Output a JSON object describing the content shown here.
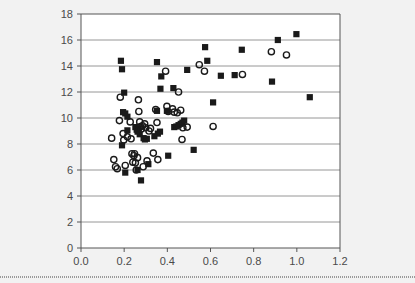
{
  "chart_data": {
    "type": "scatter",
    "title": "",
    "xlabel": "",
    "ylabel": "",
    "xlim": [
      0.0,
      1.2
    ],
    "ylim": [
      0,
      18
    ],
    "xticks": [
      "0.0",
      "0.2",
      "0.4",
      "0.6",
      "0.8",
      "1.0",
      "1.2"
    ],
    "xtick_values": [
      0.0,
      0.2,
      0.4,
      0.6,
      0.8,
      1.0,
      1.2
    ],
    "yticks": [
      "0",
      "2",
      "4",
      "6",
      "8",
      "10",
      "12",
      "14",
      "16",
      "18"
    ],
    "ytick_values": [
      0,
      2,
      4,
      6,
      8,
      10,
      12,
      14,
      16,
      18
    ],
    "grid": "horizontal",
    "legend": "none",
    "series": [
      {
        "name": "filled-squares",
        "marker": "square",
        "color": "#1a1a1a",
        "filled": true,
        "points": [
          [
            0.185,
            14.4
          ],
          [
            0.19,
            13.75
          ],
          [
            0.2,
            11.95
          ],
          [
            0.195,
            10.45
          ],
          [
            0.205,
            10.35
          ],
          [
            0.215,
            10.1
          ],
          [
            0.215,
            9.05
          ],
          [
            0.19,
            7.9
          ],
          [
            0.205,
            5.8
          ],
          [
            0.252,
            9.3
          ],
          [
            0.258,
            9.1
          ],
          [
            0.262,
            8.95
          ],
          [
            0.268,
            9.2
          ],
          [
            0.272,
            8.75
          ],
          [
            0.262,
            6.0
          ],
          [
            0.278,
            5.2
          ],
          [
            0.29,
            8.45
          ],
          [
            0.296,
            8.35
          ],
          [
            0.305,
            8.4
          ],
          [
            0.312,
            6.45
          ],
          [
            0.352,
            14.3
          ],
          [
            0.368,
            12.25
          ],
          [
            0.372,
            13.2
          ],
          [
            0.352,
            10.55
          ],
          [
            0.34,
            8.6
          ],
          [
            0.356,
            8.8
          ],
          [
            0.366,
            8.95
          ],
          [
            0.398,
            10.55
          ],
          [
            0.404,
            7.1
          ],
          [
            0.428,
            12.3
          ],
          [
            0.432,
            9.3
          ],
          [
            0.442,
            9.35
          ],
          [
            0.452,
            9.45
          ],
          [
            0.462,
            9.55
          ],
          [
            0.47,
            9.65
          ],
          [
            0.478,
            9.8
          ],
          [
            0.492,
            13.7
          ],
          [
            0.522,
            7.55
          ],
          [
            0.575,
            15.45
          ],
          [
            0.585,
            14.4
          ],
          [
            0.612,
            11.2
          ],
          [
            0.648,
            13.25
          ],
          [
            0.712,
            13.3
          ],
          [
            0.745,
            15.25
          ],
          [
            0.885,
            12.8
          ],
          [
            0.912,
            16.0
          ],
          [
            0.998,
            16.45
          ],
          [
            1.06,
            11.6
          ]
        ]
      },
      {
        "name": "open-circles",
        "marker": "circle",
        "color": "#1a1a1a",
        "filled": false,
        "points": [
          [
            0.142,
            8.45
          ],
          [
            0.152,
            6.8
          ],
          [
            0.16,
            6.25
          ],
          [
            0.168,
            6.1
          ],
          [
            0.178,
            9.8
          ],
          [
            0.182,
            11.6
          ],
          [
            0.195,
            8.8
          ],
          [
            0.198,
            8.3
          ],
          [
            0.205,
            6.35
          ],
          [
            0.215,
            8.55
          ],
          [
            0.228,
            9.7
          ],
          [
            0.232,
            8.4
          ],
          [
            0.236,
            7.25
          ],
          [
            0.24,
            6.6
          ],
          [
            0.245,
            7.1
          ],
          [
            0.248,
            7.25
          ],
          [
            0.252,
            6.55
          ],
          [
            0.256,
            6.0
          ],
          [
            0.262,
            6.95
          ],
          [
            0.266,
            11.4
          ],
          [
            0.268,
            10.5
          ],
          [
            0.272,
            9.7
          ],
          [
            0.276,
            9.35
          ],
          [
            0.28,
            9.15
          ],
          [
            0.285,
            9.4
          ],
          [
            0.288,
            6.25
          ],
          [
            0.295,
            9.55
          ],
          [
            0.3,
            9.25
          ],
          [
            0.306,
            6.7
          ],
          [
            0.315,
            9.0
          ],
          [
            0.322,
            9.2
          ],
          [
            0.335,
            7.3
          ],
          [
            0.346,
            10.65
          ],
          [
            0.352,
            9.65
          ],
          [
            0.356,
            6.8
          ],
          [
            0.392,
            13.6
          ],
          [
            0.398,
            10.9
          ],
          [
            0.404,
            10.5
          ],
          [
            0.424,
            10.7
          ],
          [
            0.432,
            10.45
          ],
          [
            0.446,
            10.4
          ],
          [
            0.452,
            12.0
          ],
          [
            0.462,
            10.6
          ],
          [
            0.468,
            8.35
          ],
          [
            0.472,
            9.25
          ],
          [
            0.492,
            9.3
          ],
          [
            0.548,
            14.1
          ],
          [
            0.572,
            13.6
          ],
          [
            0.612,
            9.35
          ],
          [
            0.748,
            13.35
          ],
          [
            0.882,
            15.1
          ],
          [
            0.952,
            14.85
          ]
        ]
      }
    ]
  },
  "figure": {
    "background_color": "#f2f2f2",
    "plot_background_color": "#ffffff",
    "gridline_color": "#8a8a8a",
    "axis_color": "#555555",
    "marker_color": "#1a1a1a"
  }
}
